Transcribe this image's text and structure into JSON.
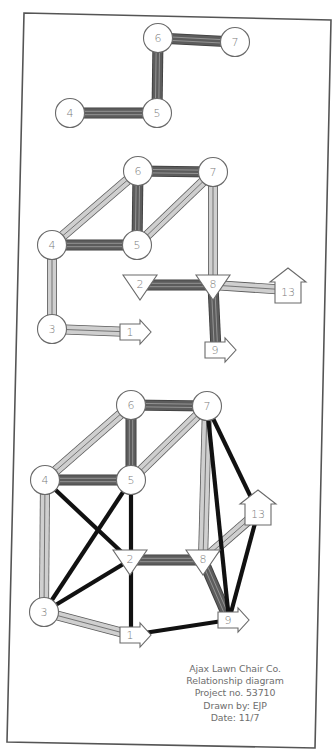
{
  "colors": {
    "frame": "#555555",
    "node_fill": "#ffffff",
    "node_stroke": "#6a6a6a",
    "dark_edge_fill": "#5c5c5c",
    "dark_edge_stripe": "#9a9a9a",
    "light_edge_fill": "#cfcfcf",
    "light_edge_stripe": "#6a6a6a",
    "black_edge": "#111111",
    "label": "#7a7a7a"
  },
  "frame": {
    "corners": [
      [
        24,
        13
      ],
      [
        331,
        20
      ],
      [
        315,
        748
      ],
      [
        7,
        742
      ]
    ]
  },
  "diagrams": [
    {
      "id": "diagram-1",
      "nodes": [
        {
          "id": "6",
          "label": "6",
          "shape": "circle",
          "x": 158,
          "y": 38
        },
        {
          "id": "7",
          "label": "7",
          "shape": "circle",
          "x": 235,
          "y": 42
        },
        {
          "id": "4",
          "label": "4",
          "shape": "circle",
          "x": 70,
          "y": 113
        },
        {
          "id": "5",
          "label": "5",
          "shape": "circle",
          "x": 157,
          "y": 113
        }
      ],
      "edges": [
        {
          "from": "6",
          "to": "7",
          "type": "dark"
        },
        {
          "from": "6",
          "to": "5",
          "type": "dark"
        },
        {
          "from": "4",
          "to": "5",
          "type": "dark"
        }
      ]
    },
    {
      "id": "diagram-2",
      "nodes": [
        {
          "id": "6",
          "label": "6",
          "shape": "circle",
          "x": 138,
          "y": 171
        },
        {
          "id": "7",
          "label": "7",
          "shape": "circle",
          "x": 213,
          "y": 172
        },
        {
          "id": "4",
          "label": "4",
          "shape": "circle",
          "x": 52,
          "y": 245
        },
        {
          "id": "5",
          "label": "5",
          "shape": "circle",
          "x": 137,
          "y": 245
        },
        {
          "id": "2",
          "label": "2",
          "shape": "triangle",
          "x": 140,
          "y": 287
        },
        {
          "id": "8",
          "label": "8",
          "shape": "triangle",
          "x": 213,
          "y": 287
        },
        {
          "id": "13",
          "label": "13",
          "shape": "house",
          "x": 288,
          "y": 290
        },
        {
          "id": "3",
          "label": "3",
          "shape": "circle",
          "x": 52,
          "y": 329
        },
        {
          "id": "1",
          "label": "1",
          "shape": "arrow",
          "x": 135,
          "y": 332
        },
        {
          "id": "9",
          "label": "9",
          "shape": "arrow",
          "x": 220,
          "y": 350
        }
      ],
      "edges": [
        {
          "from": "6",
          "to": "7",
          "type": "dark"
        },
        {
          "from": "6",
          "to": "5",
          "type": "dark"
        },
        {
          "from": "4",
          "to": "5",
          "type": "dark"
        },
        {
          "from": "4",
          "to": "6",
          "type": "light"
        },
        {
          "from": "5",
          "to": "7",
          "type": "light"
        },
        {
          "from": "7",
          "to": "8",
          "type": "light"
        },
        {
          "from": "4",
          "to": "3",
          "type": "light"
        },
        {
          "from": "3",
          "to": "1",
          "type": "light"
        },
        {
          "from": "2",
          "to": "8",
          "type": "dark"
        },
        {
          "from": "8",
          "to": "13",
          "type": "light"
        },
        {
          "from": "8",
          "to": "9",
          "type": "dark"
        }
      ]
    },
    {
      "id": "diagram-3",
      "nodes": [
        {
          "id": "6",
          "label": "6",
          "shape": "circle",
          "x": 131,
          "y": 405
        },
        {
          "id": "7",
          "label": "7",
          "shape": "circle",
          "x": 207,
          "y": 406
        },
        {
          "id": "4",
          "label": "4",
          "shape": "circle",
          "x": 45,
          "y": 480
        },
        {
          "id": "5",
          "label": "5",
          "shape": "circle",
          "x": 131,
          "y": 480
        },
        {
          "id": "13",
          "label": "13",
          "shape": "house",
          "x": 258,
          "y": 512
        },
        {
          "id": "2",
          "label": "2",
          "shape": "triangle",
          "x": 130,
          "y": 562
        },
        {
          "id": "8",
          "label": "8",
          "shape": "triangle",
          "x": 203,
          "y": 562
        },
        {
          "id": "3",
          "label": "3",
          "shape": "circle",
          "x": 44,
          "y": 612
        },
        {
          "id": "1",
          "label": "1",
          "shape": "arrow",
          "x": 135,
          "y": 635
        },
        {
          "id": "9",
          "label": "9",
          "shape": "arrow",
          "x": 233,
          "y": 620
        }
      ],
      "edges": [
        {
          "from": "6",
          "to": "7",
          "type": "dark"
        },
        {
          "from": "6",
          "to": "5",
          "type": "dark"
        },
        {
          "from": "4",
          "to": "5",
          "type": "dark"
        },
        {
          "from": "4",
          "to": "6",
          "type": "light"
        },
        {
          "from": "5",
          "to": "7",
          "type": "light"
        },
        {
          "from": "7",
          "to": "8",
          "type": "light"
        },
        {
          "from": "4",
          "to": "3",
          "type": "light"
        },
        {
          "from": "3",
          "to": "1",
          "type": "light"
        },
        {
          "from": "2",
          "to": "8",
          "type": "dark"
        },
        {
          "from": "8",
          "to": "13",
          "type": "light"
        },
        {
          "from": "8",
          "to": "9",
          "type": "dark"
        },
        {
          "from": "4",
          "to": "2",
          "type": "black"
        },
        {
          "from": "5",
          "to": "3",
          "type": "black"
        },
        {
          "from": "5",
          "to": "1",
          "type": "black"
        },
        {
          "from": "2",
          "to": "3",
          "type": "black"
        },
        {
          "from": "1",
          "to": "9",
          "type": "black"
        },
        {
          "from": "7",
          "to": "13",
          "type": "black"
        },
        {
          "from": "7",
          "to": "9",
          "type": "black"
        },
        {
          "from": "13",
          "to": "9",
          "type": "black"
        }
      ]
    }
  ],
  "caption": {
    "company": "Ajax Lawn Chair Co.",
    "title": "Relationship diagram",
    "project": "Project no. 53710",
    "drawn_by": "Drawn by: EJP",
    "date": "Date: 11/7"
  }
}
